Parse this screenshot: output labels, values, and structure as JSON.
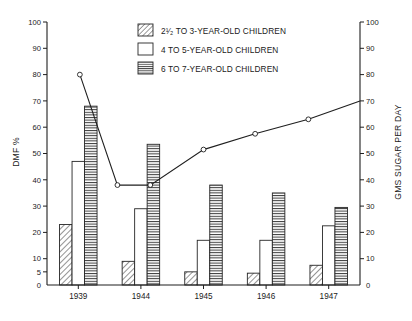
{
  "chart_data": {
    "type": "bar",
    "title": "",
    "categories": [
      "1939",
      "1944",
      "1945",
      "1946",
      "1947"
    ],
    "xlabel": "",
    "ylabel": "DMF %",
    "ylim": [
      0,
      100
    ],
    "y2label": "GMS SUGAR PER DAY",
    "y2lim": [
      0,
      100
    ],
    "grid": false,
    "legend_position": "top-center",
    "yticks": [
      5,
      10,
      20,
      30,
      40,
      50,
      60,
      70,
      80,
      90,
      100
    ],
    "yticklabels": [
      "5",
      "10",
      "20",
      "30",
      "40",
      "50",
      "60",
      "70",
      "80",
      "90",
      "100"
    ],
    "y2ticks": [
      10,
      20,
      30,
      40,
      50,
      60,
      70,
      80,
      90,
      100
    ],
    "y2ticklabels": [
      "10",
      "20",
      "30",
      "40",
      "50",
      "60",
      "70",
      "80",
      "90",
      "100"
    ],
    "origin_label": "0",
    "series": [
      {
        "name": "2¹⁄₂ TO 3-YEAR-OLD CHILDREN",
        "pattern": "diagonal-hatch",
        "axis": "left",
        "values": [
          23,
          9,
          5,
          4.5,
          7.5
        ]
      },
      {
        "name": "4 TO 5-YEAR-OLD CHILDREN",
        "pattern": "plain-white",
        "axis": "left",
        "values": [
          47,
          29,
          17,
          17,
          22.5
        ]
      },
      {
        "name": "6 TO 7-YEAR-OLD CHILDREN",
        "pattern": "horizontal-lines",
        "axis": "left",
        "values": [
          68,
          53.5,
          38,
          35,
          29.5
        ]
      }
    ],
    "line_series": {
      "name": "sugar-consumption-line",
      "axis": "right",
      "marker": "open-circle",
      "x_fraction": [
        0.105,
        0.225,
        0.33,
        0.5,
        0.665,
        0.835,
        1.0
      ],
      "values": [
        80,
        38,
        38,
        51.5,
        57.5,
        63,
        70
      ],
      "markers_shown": [
        true,
        true,
        true,
        true,
        true,
        true,
        false
      ]
    }
  },
  "legend": {
    "items": [
      {
        "label": "2¹⁄₂ TO 3-YEAR-OLD CHILDREN",
        "pattern": "diagonal-hatch"
      },
      {
        "label": "4 TO 5-YEAR-OLD CHILDREN",
        "pattern": "plain-white"
      },
      {
        "label": "6 TO 7-YEAR-OLD CHILDREN",
        "pattern": "horizontal-lines"
      }
    ]
  },
  "axes": {
    "left_title": "DMF %",
    "right_title": "GMS SUGAR PER DAY"
  }
}
